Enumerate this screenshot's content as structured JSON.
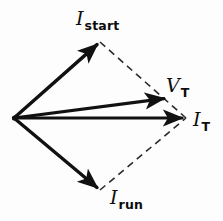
{
  "figure": {
    "type": "phasor-vector-diagram",
    "title": "",
    "background_color": "#fdfdfd",
    "stroke_color": "#111111",
    "dash_color": "#2b2b2b",
    "width": 223,
    "height": 221,
    "origin": {
      "x": 14,
      "y": 118
    }
  },
  "labels": {
    "i_start": {
      "symbol": "I",
      "subscript": "start",
      "x": 76,
      "y": 9
    },
    "v_t": {
      "symbol": "V",
      "subscript": "T",
      "x": 166,
      "y": 76
    },
    "i_t": {
      "symbol": "I",
      "subscript": "T",
      "x": 193,
      "y": 110
    },
    "i_run": {
      "symbol": "I",
      "subscript": "run",
      "x": 110,
      "y": 188
    }
  },
  "chart_data": {
    "type": "scatter",
    "title": "",
    "xlabel": "",
    "ylabel": "",
    "grid": false,
    "legend": "none",
    "origin": {
      "x": 14,
      "y": 118
    },
    "vectors": [
      {
        "name": "I_start",
        "label": "I start",
        "style": "solid-arrow",
        "stroke_width": 3.4,
        "x1": 14,
        "y1": 118,
        "x2": 100,
        "y2": 42,
        "length_px": 114.7,
        "angle_deg": 41.5
      },
      {
        "name": "V_T",
        "label": "V T",
        "style": "solid-arrow",
        "stroke_width": 3.2,
        "x1": 14,
        "y1": 118,
        "x2": 168,
        "y2": 98,
        "length_px": 155.3,
        "angle_deg": 7.4
      },
      {
        "name": "I_T",
        "label": "I T",
        "style": "solid-arrow",
        "stroke_width": 3.2,
        "x1": 14,
        "y1": 118,
        "x2": 186,
        "y2": 118,
        "length_px": 172.0,
        "angle_deg": 0.0
      },
      {
        "name": "I_run",
        "label": "I run",
        "style": "solid-arrow",
        "stroke_width": 3.4,
        "x1": 14,
        "y1": 118,
        "x2": 100,
        "y2": 190,
        "length_px": 112.2,
        "angle_deg": -39.9
      }
    ],
    "construction_lines": [
      {
        "name": "dashed-i-start-to-resultant",
        "style": "dashed",
        "x1": 100,
        "y1": 42,
        "x2": 186,
        "y2": 118
      },
      {
        "name": "dashed-i-run-to-resultant",
        "style": "dashed",
        "x1": 100,
        "y1": 190,
        "x2": 186,
        "y2": 118
      }
    ]
  }
}
